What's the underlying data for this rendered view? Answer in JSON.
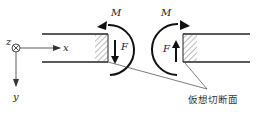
{
  "diagram": {
    "axes": {
      "x_label": "x",
      "y_label": "y",
      "z_label": "z"
    },
    "left_section": {
      "moment_label": "M",
      "force_label": "F",
      "force_direction": "down",
      "moment_direction": "counterclockwise"
    },
    "right_section": {
      "moment_label": "M",
      "force_label": "F",
      "force_direction": "up",
      "moment_direction": "clockwise"
    },
    "annotation": "仮想切断面",
    "colors": {
      "line": "#222222",
      "hatch": "#555555",
      "leader": "#444444"
    }
  }
}
